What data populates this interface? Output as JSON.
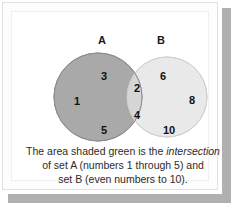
{
  "figure": {
    "type": "venn-diagram",
    "sets": [
      {
        "id": "A",
        "label": "A",
        "description": "numbers 1 through 5",
        "fill": "#a9a9a9",
        "stroke": "#8f8f8f",
        "exclusive_members": [
          "3",
          "1",
          "5"
        ]
      },
      {
        "id": "B",
        "label": "B",
        "description": "even numbers to 10",
        "fill": "#e9e9e9",
        "stroke": "#d2d2d2",
        "exclusive_members": [
          "6",
          "8",
          "10"
        ]
      }
    ],
    "intersection": {
      "label": "intersection",
      "fill": "#d6d6d6",
      "members": [
        "2",
        "4"
      ]
    },
    "members": [
      {
        "value": "3",
        "region": "A-only",
        "x": 87,
        "y": 58
      },
      {
        "value": "1",
        "region": "A-only",
        "x": 60,
        "y": 83
      },
      {
        "value": "5",
        "region": "A-only",
        "x": 87,
        "y": 112
      },
      {
        "value": "2",
        "region": "intersection",
        "x": 120,
        "y": 70
      },
      {
        "value": "4",
        "region": "intersection",
        "x": 120,
        "y": 97
      },
      {
        "value": "6",
        "region": "B-only",
        "x": 146,
        "y": 58
      },
      {
        "value": "8",
        "region": "B-only",
        "x": 175,
        "y": 82
      },
      {
        "value": "10",
        "region": "B-only",
        "x": 152,
        "y": 112
      }
    ],
    "caption": {
      "line1_before": "The area shaded green is the ",
      "line1_italic": "intersection",
      "line2": "of set A (numbers 1 through 5) and",
      "line3": "set B (even numbers to 10)."
    },
    "colors": {
      "background": "#ffffff",
      "frame_border": "#e2e2e2",
      "shadow": "#b0b0b0",
      "text": "#2b2b2b"
    }
  }
}
